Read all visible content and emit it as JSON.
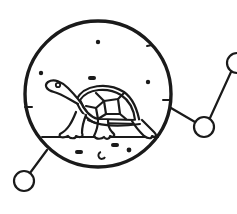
{
  "illustration": {
    "subject": "turtle-in-circle-network-icon",
    "stroke_color": "#1a1a1a",
    "background_color": "#ffffff",
    "elements": {
      "main_circle": {
        "cx": 98,
        "cy": 94,
        "r": 73
      },
      "nodes": [
        {
          "name": "node-bottom-left",
          "cx": 24,
          "cy": 181,
          "r": 10
        },
        {
          "name": "node-right-middle",
          "cx": 204,
          "cy": 127,
          "r": 10
        },
        {
          "name": "node-top-right",
          "cx": 236,
          "cy": 63,
          "r": 10
        }
      ],
      "stars": 3,
      "ground_pebbles": 5
    }
  }
}
